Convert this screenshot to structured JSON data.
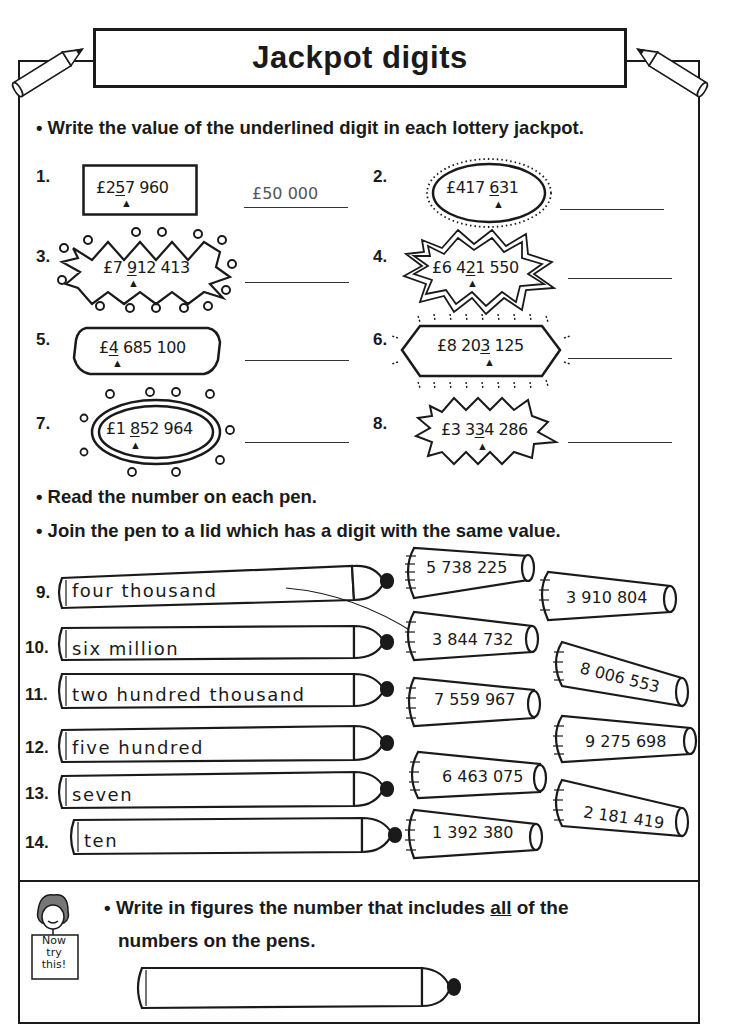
{
  "header": {
    "title": "Jackpot digits",
    "left_pencil_icon": "pencil-icon",
    "right_pencil_icon": "pencil-icon"
  },
  "section1": {
    "instruction": "• Write the value of the underlined digit in each lottery jackpot.",
    "questions": [
      {
        "num": "1.",
        "pre": "£2",
        "digit": "5",
        "post": "7 960",
        "shape": "rectangle",
        "answer": "£50 000"
      },
      {
        "num": "2.",
        "pre": "£417 ",
        "digit": "6",
        "post": "31",
        "shape": "dotted-oval",
        "answer": ""
      },
      {
        "num": "3.",
        "pre": "£7 ",
        "digit": "9",
        "post": "12 413",
        "shape": "zigzag-burst-circles",
        "answer": ""
      },
      {
        "num": "4.",
        "pre": "£6 4",
        "digit": "2",
        "post": "1 550",
        "shape": "double-star",
        "answer": ""
      },
      {
        "num": "5.",
        "pre": "£",
        "digit": "4",
        "post": " 685 100",
        "shape": "rounded-octagon",
        "answer": ""
      },
      {
        "num": "6.",
        "pre": "£8 20",
        "digit": "3",
        "post": " 125",
        "shape": "hexagon-rays",
        "answer": ""
      },
      {
        "num": "7.",
        "pre": "£1 ",
        "digit": "8",
        "post": "52 964",
        "shape": "double-oval-swirls",
        "answer": ""
      },
      {
        "num": "8.",
        "pre": "£3 3",
        "digit": "3",
        "post": "4 286",
        "shape": "star-burst",
        "answer": ""
      }
    ],
    "arrow_glyph": "▲"
  },
  "section2": {
    "instruction_1": "• Read the number on each pen.",
    "instruction_2": "• Join the pen to a lid which has a digit with the same value.",
    "pens": [
      {
        "num": "9.",
        "text": "four thousand"
      },
      {
        "num": "10.",
        "text": "six million"
      },
      {
        "num": "11.",
        "text": "two hundred thousand"
      },
      {
        "num": "12.",
        "text": "five hundred"
      },
      {
        "num": "13.",
        "text": "seven"
      },
      {
        "num": "14.",
        "text": "ten"
      }
    ],
    "lids": [
      {
        "text": "5 738 225"
      },
      {
        "text": "3 910 804"
      },
      {
        "text": "3 844 732"
      },
      {
        "text": "8 006 553"
      },
      {
        "text": "7 559 967"
      },
      {
        "text": "9 275 698"
      },
      {
        "text": "6 463 075"
      },
      {
        "text": "2 181 419"
      },
      {
        "text": "1 392 380"
      }
    ],
    "drawn_connection": {
      "from_pen": "9.",
      "to_lid": "3 844 732"
    }
  },
  "section3": {
    "badge": [
      "Now",
      "try",
      "this!"
    ],
    "instruction_1": "• Write in figures the number that includes ",
    "instruction_emph": "all",
    "instruction_2": " of the",
    "instruction_3": "numbers on the pens.",
    "answer_pen_text": ""
  }
}
